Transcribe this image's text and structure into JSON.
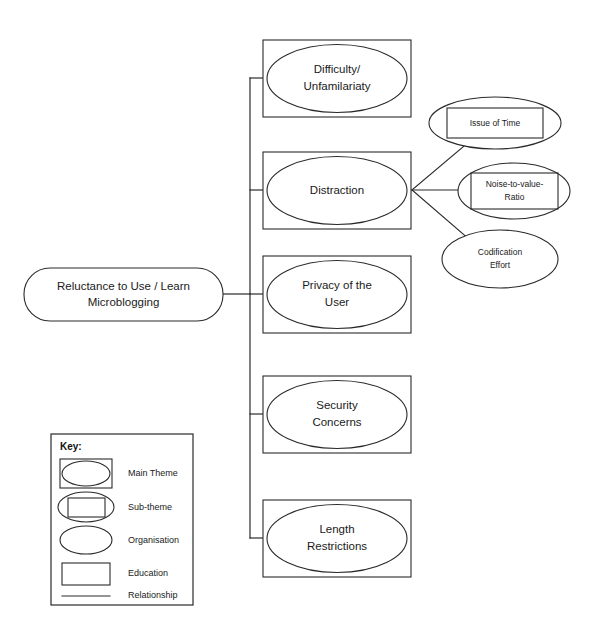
{
  "diagram": {
    "root": {
      "id": "root",
      "label_line1": "Reluctance to Use / Learn",
      "label_line2": "Microblogging",
      "shape": "rounded-rectangle",
      "category": "Main Theme"
    },
    "main_themes": [
      {
        "id": "difficulty-unfamilariaty",
        "label_line1": "Difficulty/",
        "label_line2": "Unfamilariaty",
        "shape": "ellipse-in-rectangle",
        "category": "Main Theme"
      },
      {
        "id": "distraction",
        "label_line1": "Distraction",
        "label_line2": "",
        "shape": "ellipse-in-rectangle",
        "category": "Main Theme"
      },
      {
        "id": "privacy-of-the-user",
        "label_line1": "Privacy of the",
        "label_line2": "User",
        "shape": "ellipse-in-rectangle",
        "category": "Main Theme"
      },
      {
        "id": "security-concerns",
        "label_line1": "Security",
        "label_line2": "Concerns",
        "shape": "ellipse-in-rectangle",
        "category": "Main Theme"
      },
      {
        "id": "length-restrictions",
        "label_line1": "Length",
        "label_line2": "Restrictions",
        "shape": "ellipse-in-rectangle",
        "category": "Main Theme"
      }
    ],
    "sub_themes": [
      {
        "id": "issue-of-time",
        "label_line1": "Issue of Time",
        "label_line2": "",
        "shape": "rectangle-in-ellipse",
        "category": "Sub-theme",
        "parent": "distraction"
      },
      {
        "id": "noise-to-value-ratio",
        "label_line1": "Noise-to-value-",
        "label_line2": "Ratio",
        "shape": "rectangle-in-ellipse",
        "category": "Sub-theme",
        "parent": "distraction"
      },
      {
        "id": "codification-effort",
        "label_line1": "Codification",
        "label_line2": "Effort",
        "shape": "ellipse",
        "category": "Organisation",
        "parent": "distraction"
      }
    ]
  },
  "key": {
    "title": "Key:",
    "items": [
      {
        "label": "Main Theme",
        "shape": "ellipse-in-rectangle"
      },
      {
        "label": "Sub-theme",
        "shape": "rectangle-in-ellipse"
      },
      {
        "label": "Organisation",
        "shape": "ellipse"
      },
      {
        "label": "Education",
        "shape": "rectangle"
      },
      {
        "label": "Relationship",
        "shape": "line"
      }
    ]
  },
  "colors": {
    "stroke": "#2a2a2a",
    "text": "#1a1a1a",
    "background": "#ffffff"
  }
}
